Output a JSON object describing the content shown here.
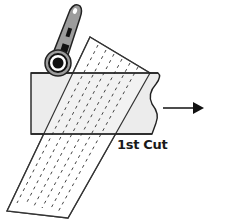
{
  "diagram": {
    "label": "1st Cut",
    "colors": {
      "outline": "#333333",
      "fabric_fill": "#eeeeee",
      "ruler_fill": "#ffffff",
      "cutter_handle": "#9a9a9a",
      "cutter_dark": "#111111",
      "arrow": "#111111"
    },
    "elements": [
      {
        "name": "rotary-cutter",
        "description": "rotary cutter with circular blade"
      },
      {
        "name": "fabric-strip",
        "description": "fabric strip with wavy right edge"
      },
      {
        "name": "ruler",
        "description": "tilted ruler with dashed guide lines"
      },
      {
        "name": "direction-arrow",
        "description": "arrow pointing right"
      }
    ]
  }
}
